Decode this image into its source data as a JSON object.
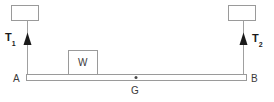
{
  "diagram": {
    "type": "free-body-diagram",
    "background_color": "#ffffff",
    "stroke_color": "#808080",
    "text_color": "#2b2b2b",
    "labels": {
      "tension_left": "T",
      "tension_left_sub": "1",
      "tension_right": "T",
      "tension_right_sub": "2",
      "point_left": "A",
      "point_right": "B",
      "center_of_gravity": "G",
      "block": "W"
    },
    "elements": {
      "support_left": {
        "name": "left-support-box",
        "x": 11,
        "y": 5,
        "width": 27,
        "height": 16
      },
      "support_right": {
        "name": "right-support-box",
        "x": 228,
        "y": 5,
        "width": 28,
        "height": 16
      },
      "rope_left": {
        "name": "left-rope",
        "x": 27,
        "y1": 21,
        "y2": 75
      },
      "rope_right": {
        "name": "right-rope",
        "x": 243,
        "y1": 21,
        "y2": 75
      },
      "arrow_left": {
        "name": "left-tension-arrow",
        "x": 27,
        "tip_y": 33,
        "base_y": 45
      },
      "arrow_right": {
        "name": "right-tension-arrow",
        "x": 243,
        "tip_y": 33,
        "base_y": 45
      },
      "beam": {
        "name": "beam",
        "x": 26,
        "y": 74,
        "width": 221,
        "height": 7
      },
      "block": {
        "name": "block-w",
        "x": 68,
        "y": 50,
        "width": 30,
        "height": 25
      },
      "cg_dot": {
        "name": "center-of-gravity-dot",
        "x": 136,
        "y": 77,
        "r": 1.4
      }
    }
  }
}
